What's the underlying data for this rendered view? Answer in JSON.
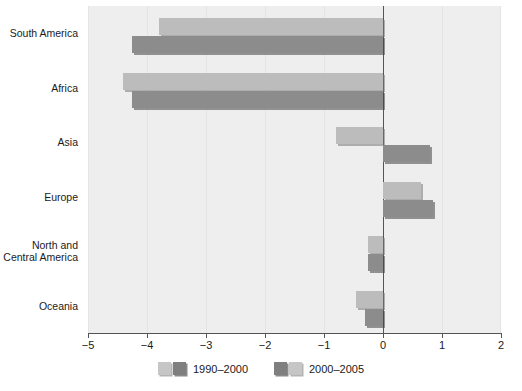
{
  "chart_data": {
    "type": "bar",
    "orientation": "horizontal",
    "title": "",
    "xlabel": "",
    "ylabel": "",
    "categories": [
      "South America",
      "Africa",
      "Asia",
      "Europe",
      "North and\nCentral America",
      "Oceania"
    ],
    "series": [
      {
        "name": "1990–2000",
        "color": "#bcbcbc",
        "values": [
          -3.8,
          -4.4,
          -0.8,
          0.65,
          -0.25,
          -0.45
        ]
      },
      {
        "name": "2000–2005",
        "color": "#8c8c8c",
        "values": [
          -4.25,
          -4.25,
          0.8,
          0.85,
          -0.25,
          -0.3
        ]
      }
    ],
    "xlim": [
      -5,
      2
    ],
    "xticks": [
      -5,
      -4,
      -3,
      -2,
      -1,
      0,
      1,
      2
    ],
    "xtick_labels": [
      "−5",
      "−4",
      "−3",
      "−2",
      "−1",
      "0",
      "1",
      "2"
    ],
    "grid": true,
    "grid_axis": "x",
    "zero_line": true,
    "legend_position": "bottom",
    "plot_background": "#eeeeee",
    "figure_background": "#ffffff"
  },
  "legend": {
    "entries": [
      {
        "label": "1990–2000"
      },
      {
        "label": "2000–2005"
      }
    ]
  }
}
